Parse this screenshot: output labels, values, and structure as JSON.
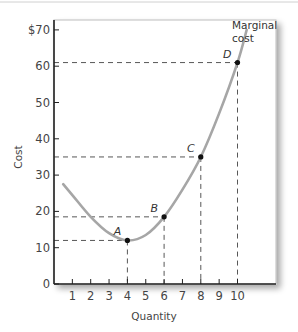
{
  "chart_data": {
    "type": "line",
    "title": "",
    "xlabel": "Quantity",
    "ylabel": "Cost",
    "xlim": [
      0,
      11
    ],
    "ylim": [
      0,
      72
    ],
    "x_ticks": [
      1,
      2,
      3,
      4,
      5,
      6,
      7,
      8,
      9,
      10
    ],
    "y_ticks": [
      0,
      10,
      20,
      30,
      40,
      50,
      60,
      70
    ],
    "y_tick_labels": [
      "0",
      "10",
      "20",
      "30",
      "40",
      "50",
      "60",
      "$70"
    ],
    "grid": false,
    "legend": null,
    "series": [
      {
        "name": "Marginal cost",
        "color": "#a6a6a6",
        "x": [
          0.5,
          1,
          2,
          3,
          4,
          5,
          6,
          7,
          8,
          9,
          10,
          10.5
        ],
        "values": [
          27.5,
          24.5,
          18.5,
          14,
          12,
          13.5,
          18.5,
          26,
          35,
          47,
          61,
          70
        ]
      }
    ],
    "points": [
      {
        "label": "A",
        "x": 4,
        "y": 12
      },
      {
        "label": "B",
        "x": 6,
        "y": 18.5
      },
      {
        "label": "C",
        "x": 8,
        "y": 35
      },
      {
        "label": "D",
        "x": 10,
        "y": 61
      }
    ],
    "annotations": [
      {
        "text": "Marginal",
        "line": 1
      },
      {
        "text": "cost",
        "line": 2
      }
    ]
  }
}
